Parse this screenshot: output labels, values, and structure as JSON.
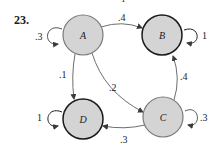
{
  "problem": {
    "number": "23."
  },
  "top_cutoff_label": "1",
  "colors": {
    "node_fill": "#d4d4d4",
    "transient_stroke": "#7a7a7a",
    "absorbing_stroke": "#1a1a1a",
    "edge": "#6e6e6e",
    "text": "#1a1a1a"
  },
  "nodes": [
    {
      "id": "A",
      "label": "A",
      "cx": 83,
      "cy": 35,
      "r": 20,
      "absorbing": false
    },
    {
      "id": "B",
      "label": "B",
      "cx": 162,
      "cy": 35,
      "r": 20,
      "absorbing": true
    },
    {
      "id": "C",
      "label": "C",
      "cx": 163,
      "cy": 117,
      "r": 20,
      "absorbing": false
    },
    {
      "id": "D",
      "label": "D",
      "cx": 83,
      "cy": 119,
      "r": 20,
      "absorbing": true
    }
  ],
  "edges": [
    {
      "from": "A",
      "to": "A",
      "label": ".3",
      "type": "self-loop"
    },
    {
      "from": "A",
      "to": "B",
      "label": ".4"
    },
    {
      "from": "A",
      "to": "D",
      "label": ".1"
    },
    {
      "from": "A",
      "to": "C",
      "label": ".2"
    },
    {
      "from": "B",
      "to": "B",
      "label": "1",
      "type": "self-loop"
    },
    {
      "from": "C",
      "to": "B",
      "label": ".4"
    },
    {
      "from": "C",
      "to": "C",
      "label": ".3",
      "type": "self-loop"
    },
    {
      "from": "C",
      "to": "D",
      "label": ".3"
    },
    {
      "from": "D",
      "to": "D",
      "label": "1",
      "type": "self-loop"
    }
  ],
  "labels": {
    "A_self": ".3",
    "A_to_B": ".4",
    "A_to_D": ".1",
    "A_to_C": ".2",
    "B_self": "1",
    "C_to_B": ".4",
    "C_self": ".3",
    "C_to_D": ".3",
    "D_self": "1",
    "node_A": "A",
    "node_B": "B",
    "node_C": "C",
    "node_D": "D"
  }
}
